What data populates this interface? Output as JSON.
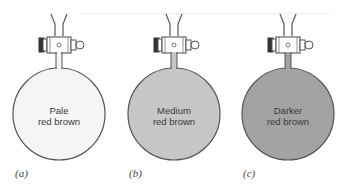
{
  "figure": {
    "panels": [
      {
        "label": "(a)",
        "line1": "Pale",
        "line2": "red brown",
        "fill": "#f5f5f5"
      },
      {
        "label": "(b)",
        "line1": "Medium",
        "line2": "red brown",
        "fill": "#c6c6c6"
      },
      {
        "label": "(c)",
        "line1": "Darker",
        "line2": "red brown",
        "fill": "#a3a3a3"
      }
    ],
    "outline_color": "#555555"
  }
}
